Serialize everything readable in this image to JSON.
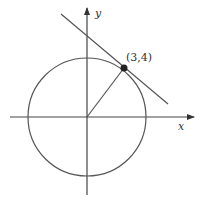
{
  "diagram": {
    "type": "tangent-line-to-circle",
    "axes": {
      "x_label": "x",
      "y_label": "y"
    },
    "circle": {
      "center": [
        0,
        0
      ],
      "radius": 5
    },
    "point": {
      "label": "(3,4)",
      "coords": [
        3,
        4
      ]
    },
    "radius_segment": {
      "from": [
        0,
        0
      ],
      "to": [
        3,
        4
      ]
    },
    "tangent_line": {
      "through": [
        3,
        4
      ],
      "perpendicular_to_radius": true
    },
    "colors": {
      "stroke": "#444444",
      "point": "#222222"
    }
  }
}
